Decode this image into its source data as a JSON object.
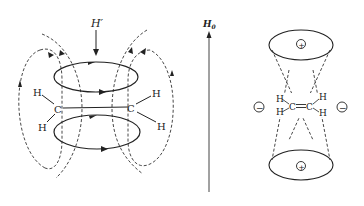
{
  "left_panel": {
    "induced_field_label": "H′",
    "atoms": {
      "carbon_left": "C",
      "carbon_right": "C",
      "h_left_top": "H",
      "h_left_bottom": "H",
      "h_right_top": "H",
      "h_right_bottom": "H"
    },
    "description": "π-electron circulation in ethylene with induced magnetic field lines"
  },
  "middle": {
    "applied_field_label": "H",
    "applied_field_subscript": "0"
  },
  "right_panel": {
    "atoms": {
      "carbon_left": "C",
      "carbon_right": "C",
      "h_left_top": "H",
      "h_left_bottom": "H",
      "h_right_top": "H",
      "h_right_bottom": "H"
    },
    "shielding_top": "+",
    "shielding_bottom": "+",
    "deshielding_left": "−",
    "deshielding_right": "−",
    "description": "Anisotropic shielding cones of C=C double bond"
  },
  "colors": {
    "stroke": "#222222",
    "background": "#ffffff"
  }
}
